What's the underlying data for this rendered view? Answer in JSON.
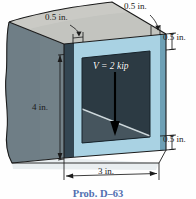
{
  "figure": {
    "caption": "Prob. D–63",
    "colors": {
      "left_face": "#6f7e86",
      "top_face": "#c3c4bf",
      "front_frame": "#a9d2e3",
      "front_frame_dark_edge": "#5b8fa6",
      "cavity": "#2c3a43",
      "cavity_light": "#47565f",
      "diagonal_line": "#c9d4d8",
      "outline": "#1b1b1b",
      "caption_blue": "#2b4f9e",
      "load_arrow": "#000000",
      "load_label": "#ffffff"
    }
  },
  "labels": {
    "load": "V = 2 kip",
    "thickness_top_left": "0.5 in.",
    "thickness_top_right": "0.5 in.",
    "thickness_right_top": "0.5 in.",
    "thickness_right_bottom": "0.5 in.",
    "height": "4 in.",
    "width": "3 in."
  },
  "dimensions": {
    "wall_thickness": "0.5 in.",
    "overall_height": "4 in.",
    "overall_width": "3 in.",
    "shear_force": "2 kip",
    "force_symbol": "V"
  }
}
